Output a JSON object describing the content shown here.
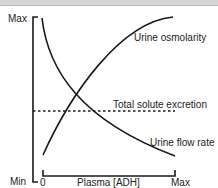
{
  "diagram": {
    "title": "",
    "y_axis": {
      "max_label": "Max",
      "min_label": "Min"
    },
    "x_axis": {
      "start_label": "0",
      "end_label": "Max",
      "title": "Plasma [ADH]"
    },
    "curves": [
      {
        "name": "Urine osmolarity",
        "trend": "increasing, concave",
        "color": "#1a1a1a",
        "style": "solid"
      },
      {
        "name": "Urine flow rate",
        "trend": "decreasing, convex",
        "color": "#1a1a1a",
        "style": "solid"
      },
      {
        "name": "Total solute excretion",
        "trend": "constant",
        "color": "#1a1a1a",
        "style": "dotted"
      }
    ],
    "labels": {
      "urine_osmolarity": "Urine osmolarity",
      "total_solute_excretion": "Total solute excretion",
      "urine_flow_rate": "Urine flow rate"
    }
  }
}
